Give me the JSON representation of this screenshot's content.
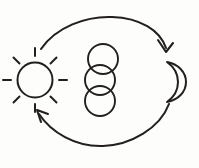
{
  "diagram": {
    "title": "Day and night cycle",
    "background_color": "#fdfdfc",
    "stroke_color": "#231f20",
    "nodes": [
      {
        "id": "sun",
        "icon": "sun-icon",
        "label": "Sun",
        "position": "left",
        "center_x": 35,
        "center_y": 80,
        "radius": 18,
        "ray_count": 8
      },
      {
        "id": "circles",
        "icon": "overlapping-circles-icon",
        "label": "Overlapping circles",
        "position": "center",
        "circle_count": 3,
        "circle_radius": 15
      },
      {
        "id": "moon",
        "icon": "crescent-moon-icon",
        "label": "Moon",
        "position": "right",
        "center_x": 170,
        "center_y": 82,
        "opening": "left"
      }
    ],
    "arrows": [
      {
        "id": "arrow-top",
        "label": "Sun to moon",
        "direction": "clockwise",
        "from": "sun",
        "to": "moon",
        "head_position": "right"
      },
      {
        "id": "arrow-bottom",
        "label": "Moon to sun",
        "direction": "clockwise",
        "from": "moon",
        "to": "sun",
        "head_position": "left"
      }
    ]
  }
}
